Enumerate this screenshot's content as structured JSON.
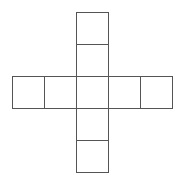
{
  "diagram": {
    "type": "cube-net",
    "stroke_color": "#555555",
    "fill_color": "#ffffff",
    "cell_size": 32,
    "origin": [
      12,
      12
    ],
    "cells": [
      {
        "col": 2,
        "row": 0
      },
      {
        "col": 2,
        "row": 1
      },
      {
        "col": 0,
        "row": 2
      },
      {
        "col": 1,
        "row": 2
      },
      {
        "col": 2,
        "row": 2
      },
      {
        "col": 3,
        "row": 2
      },
      {
        "col": 4,
        "row": 2
      },
      {
        "col": 2,
        "row": 3
      },
      {
        "col": 2,
        "row": 4
      }
    ]
  }
}
